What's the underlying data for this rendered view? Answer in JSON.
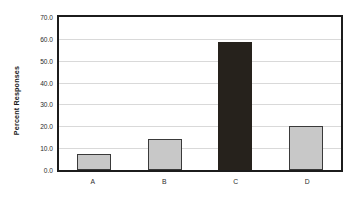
{
  "chart_data": {
    "type": "bar",
    "title": "",
    "xlabel": "",
    "ylabel": "Percent Responses",
    "categories": [
      "A",
      "B",
      "C",
      "D"
    ],
    "values": [
      7.3,
      14.0,
      58.7,
      20.1
    ],
    "ylim": [
      0.0,
      70.0
    ],
    "ytick_labels": [
      "70.0",
      "60.0",
      "50.0",
      "40.0",
      "30.0",
      "20.0",
      "10.0",
      "0.0"
    ],
    "ytick_values": [
      70.0,
      60.0,
      50.0,
      40.0,
      30.0,
      20.0,
      10.0,
      0.0
    ],
    "grid": "horizontal",
    "legend": "none",
    "bar_colors": [
      "#c8c8c8",
      "#c8c8c8",
      "#26221c",
      "#c8c8c8"
    ],
    "bar_border_color": "#3a3a3a",
    "plot_border_color": "#1c1c1c",
    "gridline_color": "#d9d9d9",
    "background_color": "#ffffff"
  }
}
